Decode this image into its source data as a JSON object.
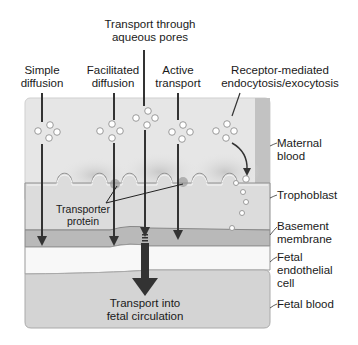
{
  "diagram": {
    "top_labels": {
      "pores": [
        "Transport through",
        "aqueous pores"
      ],
      "simple": [
        "Simple",
        "diffusion"
      ],
      "facilitated": [
        "Facilitated",
        "diffusion"
      ],
      "active": [
        "Active",
        "transport"
      ],
      "receptor": [
        "Receptor-mediated",
        "endocytosis/exocytosis"
      ]
    },
    "layer_labels": {
      "maternal": [
        "Maternal",
        "blood"
      ],
      "trophoblast": [
        "Trophoblast"
      ],
      "basement": [
        "Basement",
        "membrane"
      ],
      "endothelial": [
        "Fetal",
        "endothelial",
        "cell"
      ],
      "fetal_blood": [
        "Fetal blood"
      ]
    },
    "transporter_label": [
      "Transporter",
      "protein"
    ],
    "bottom_label": [
      "Transport into",
      "fetal circulation"
    ],
    "colors": {
      "maternal_blood": "#e6e6e6",
      "maternal_edge": "#bdbdbd",
      "trophoblast": "#d9d9d9",
      "basement": "#b8b8b8",
      "endothelial": "#f7f7f7",
      "fetal_blood": "#d2d2d2",
      "arrow": "#3a3a3a"
    }
  }
}
